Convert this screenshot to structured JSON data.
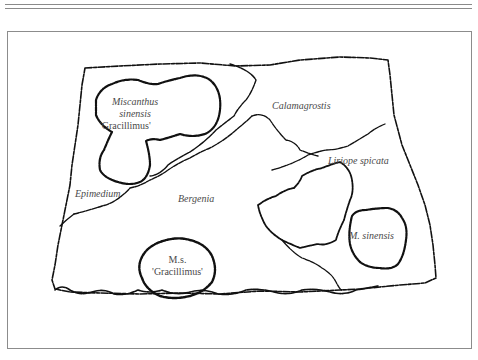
{
  "diagram": {
    "type": "planting-plan",
    "colors": {
      "ink": "#111111",
      "label": "#4a4a4a",
      "frame": "#8c8c8c"
    },
    "labels": {
      "miscanthus_1": "Miscanthus",
      "miscanthus_2": "sinensis",
      "miscanthus_3": "'Gracillimus'",
      "calamagrostis": "Calamagrostis",
      "liriope": "Liriope spicata",
      "epimedium": "Epimedium",
      "bergenia": "Bergenia",
      "ms_1": "M.s.",
      "ms_2": "'Gracillimus'",
      "m_sinensis": "M. sinensis"
    },
    "regions": [
      {
        "name": "Miscanthus sinensis 'Gracillimus'",
        "kind": "clump"
      },
      {
        "name": "Calamagrostis",
        "kind": "bed"
      },
      {
        "name": "Liriope spicata",
        "kind": "bed"
      },
      {
        "name": "Epimedium",
        "kind": "bed"
      },
      {
        "name": "Bergenia",
        "kind": "bed"
      },
      {
        "name": "M.s. 'Gracillimus'",
        "kind": "clump"
      },
      {
        "name": "M. sinensis",
        "kind": "clump"
      }
    ]
  }
}
